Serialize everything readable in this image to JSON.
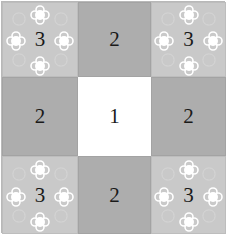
{
  "diagram": {
    "type": "3x3 grid",
    "colors": {
      "corner": "#c9c9c9",
      "edge": "#adadad",
      "center": "#ffffff"
    },
    "cells": [
      {
        "row": 0,
        "col": 0,
        "label": "3",
        "kind": "corner"
      },
      {
        "row": 0,
        "col": 1,
        "label": "2",
        "kind": "edge"
      },
      {
        "row": 0,
        "col": 2,
        "label": "3",
        "kind": "corner"
      },
      {
        "row": 1,
        "col": 0,
        "label": "2",
        "kind": "edge"
      },
      {
        "row": 1,
        "col": 1,
        "label": "1",
        "kind": "center"
      },
      {
        "row": 1,
        "col": 2,
        "label": "2",
        "kind": "edge"
      },
      {
        "row": 2,
        "col": 0,
        "label": "3",
        "kind": "corner"
      },
      {
        "row": 2,
        "col": 1,
        "label": "2",
        "kind": "edge"
      },
      {
        "row": 2,
        "col": 2,
        "label": "3",
        "kind": "corner"
      }
    ],
    "corner_ornament": "four white quatrefoil flowers (top, left, right, bottom) around the number"
  }
}
